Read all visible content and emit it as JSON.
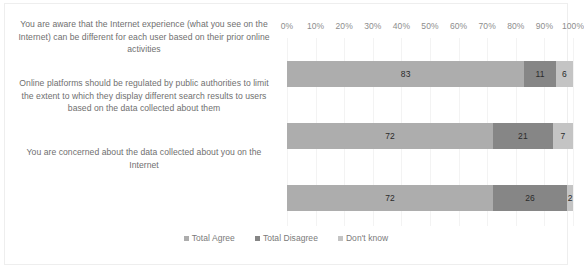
{
  "chart_data": {
    "type": "bar",
    "orientation": "horizontal",
    "stacked": "100%",
    "title": "",
    "subtitle": "",
    "xlabel": "",
    "ylabel": "",
    "xlim": [
      0,
      100
    ],
    "grid": true,
    "legend_position": "bottom",
    "axis_tick_labels": [
      "0%",
      "10%",
      "20%",
      "30%",
      "40%",
      "50%",
      "60%",
      "70%",
      "80%",
      "90%",
      "100%"
    ],
    "axis_tick_values": [
      0,
      10,
      20,
      30,
      40,
      50,
      60,
      70,
      80,
      90,
      100
    ],
    "categories": [
      "You are aware that the Internet experience (what you see on the Internet) can be different for each user based on their prior online activities",
      "Online platforms should be regulated by public authorities to limit the extent to which they display different search results to users based on the data collected about them",
      "You are concerned about the data collected about you on the Internet"
    ],
    "series": [
      {
        "name": "Total Agree",
        "color": "#adadad",
        "values": [
          83,
          72,
          72
        ]
      },
      {
        "name": "Total Disagree",
        "color": "#868686",
        "values": [
          11,
          21,
          26
        ]
      },
      {
        "name": "Don't know",
        "color": "#c4c4c4",
        "values": [
          6,
          7,
          2
        ]
      }
    ]
  },
  "legend": {
    "items": [
      {
        "label": "Total Agree",
        "color": "#adadad"
      },
      {
        "label": "Total Disagree",
        "color": "#868686"
      },
      {
        "label": "Don't know",
        "color": "#c4c4c4"
      }
    ]
  },
  "colors": {
    "total_agree": "#adadad",
    "total_disagree": "#868686",
    "dont_know": "#c4c4c4",
    "gridline": "#f3f3f3",
    "frame_border": "#eeeeee",
    "tick_text": "#8d8d8d",
    "category_text": "#6f6f6f",
    "value_text": "#2b2b2b"
  }
}
